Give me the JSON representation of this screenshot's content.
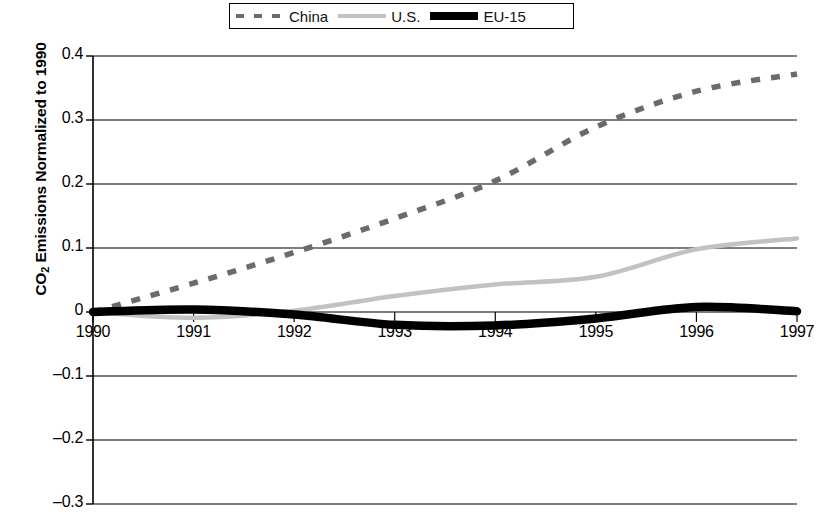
{
  "legend": {
    "position": "top-center",
    "entries": [
      {
        "label": "China",
        "style": "dashed",
        "color": "#6b6b6b"
      },
      {
        "label": "U.S.",
        "style": "solid-thin",
        "color": "#c2c2c2"
      },
      {
        "label": "EU-15",
        "style": "solid-thick",
        "color": "#000000"
      }
    ]
  },
  "axes": {
    "y_title_main": "CO",
    "y_title_sub": "2",
    "y_title_rest": " Emissions Normalized to 1990",
    "y_ticks": [
      "0.4",
      "0.3",
      "0.2",
      "0.1",
      "0",
      "–0.1",
      "–0.2",
      "–0.3"
    ],
    "x_ticks": [
      "1990",
      "1991",
      "1992",
      "1993",
      "1994",
      "1995",
      "1996",
      "1997"
    ]
  },
  "chart_data": {
    "type": "line",
    "title": "",
    "xlabel": "",
    "ylabel": "CO2 Emissions Normalized to 1990",
    "xlim": [
      1990,
      1997
    ],
    "ylim": [
      -0.3,
      0.4
    ],
    "grid": true,
    "legend_position": "top-center",
    "x": [
      1990,
      1991,
      1992,
      1993,
      1994,
      1995,
      1996,
      1997
    ],
    "series": [
      {
        "name": "China",
        "style": "dashed",
        "color": "#6b6b6b",
        "values": [
          0.0,
          0.045,
          0.093,
          0.146,
          0.205,
          0.289,
          0.345,
          0.372
        ]
      },
      {
        "name": "U.S.",
        "style": "solid-thin",
        "color": "#c2c2c2",
        "values": [
          0.0,
          -0.009,
          0.002,
          0.025,
          0.043,
          0.055,
          0.098,
          0.115
        ]
      },
      {
        "name": "EU-15",
        "style": "solid-thick",
        "color": "#000000",
        "values": [
          0.0,
          0.004,
          -0.004,
          -0.02,
          -0.021,
          -0.01,
          0.008,
          0.001
        ]
      }
    ]
  }
}
